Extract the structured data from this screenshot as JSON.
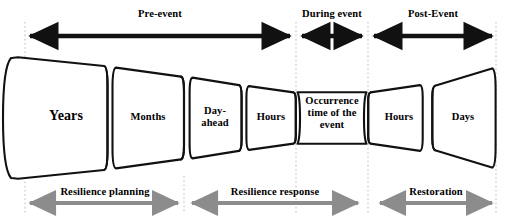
{
  "figure": {
    "colors": {
      "outline": "#111111",
      "fill": "#ffffff",
      "top_arrow": "#111111",
      "bottom_arrow": "#8c8c8c",
      "divider": "#cfcfcf",
      "text": "#000000"
    }
  },
  "top_phases": [
    {
      "id": "pre-event",
      "label": "Pre-event",
      "arrow_x1": 28,
      "arrow_x2": 292,
      "label_cx": 160,
      "label_y": 9
    },
    {
      "id": "during-event",
      "label": "During event",
      "arrow_x1": 300,
      "arrow_x2": 364,
      "label_cx": 332,
      "label_y": 9
    },
    {
      "id": "post-event",
      "label": "Post-Event",
      "arrow_x1": 372,
      "arrow_x2": 494,
      "label_cx": 433,
      "label_y": 9
    }
  ],
  "segments": [
    {
      "id": "years",
      "label": "Years",
      "font_size": 14,
      "cx": 66,
      "cy": 118
    },
    {
      "id": "months",
      "label": "Months",
      "font_size": 10.5,
      "cx": 148,
      "cy": 118
    },
    {
      "id": "day-ahead",
      "label": "Day-\nahead",
      "font_size": 10.5,
      "cx": 215,
      "cy": 112
    },
    {
      "id": "hours-pre",
      "label": "Hours",
      "font_size": 10.5,
      "cx": 270,
      "cy": 118
    },
    {
      "id": "occurrence",
      "label": "Occurrence\ntime of the\nevent",
      "font_size": 10.5,
      "cx": 332,
      "cy": 102
    },
    {
      "id": "hours-post",
      "label": "Hours",
      "font_size": 10.5,
      "cx": 398,
      "cy": 118
    },
    {
      "id": "days",
      "label": "Days",
      "font_size": 10.5,
      "cx": 462,
      "cy": 118
    }
  ],
  "bottom_stages": [
    {
      "id": "resilience-planning",
      "label": "Resilience planning",
      "arrow_x1": 28,
      "arrow_x2": 180,
      "label_cx": 104,
      "label_y": 186
    },
    {
      "id": "resilience-response",
      "label": "Resilience response",
      "arrow_x1": 190,
      "arrow_x2": 360,
      "label_cx": 275,
      "label_y": 186
    },
    {
      "id": "restoration",
      "label": "Restoration",
      "arrow_x1": 378,
      "arrow_x2": 494,
      "label_cx": 436,
      "label_y": 186
    }
  ],
  "dividers": [
    {
      "id": "divider-left",
      "x": 25
    },
    {
      "id": "divider-mid-a",
      "x": 184
    },
    {
      "id": "divider-mid-b",
      "x": 296
    },
    {
      "id": "divider-mid-c",
      "x": 368
    },
    {
      "id": "divider-right",
      "x": 496
    }
  ]
}
